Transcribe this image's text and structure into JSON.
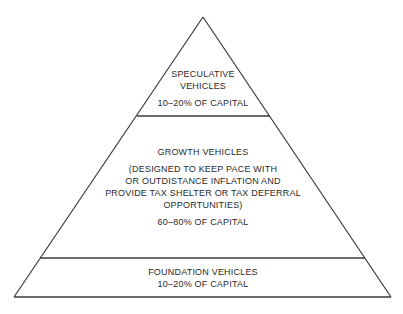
{
  "diagram": {
    "type": "pyramid",
    "colors": {
      "line": "#3a3a3a",
      "text": "#2a2a2a",
      "background": "#ffffff"
    },
    "tiers": [
      {
        "title_lines": [
          "SPECULATIVE",
          "VEHICLES"
        ],
        "allocation": "10–20% OF CAPITAL"
      },
      {
        "title_lines": [
          "GROWTH VEHICLES"
        ],
        "description_lines": [
          "(DESIGNED TO KEEP PACE WITH",
          "OR OUTDISTANCE INFLATION AND",
          "PROVIDE TAX SHELTER OR TAX DEFERRAL",
          "OPPORTUNITIES)"
        ],
        "allocation": "60–80% OF CAPITAL"
      },
      {
        "title_lines": [
          "FOUNDATION VEHICLES"
        ],
        "allocation": "10–20% OF CAPITAL"
      }
    ]
  }
}
